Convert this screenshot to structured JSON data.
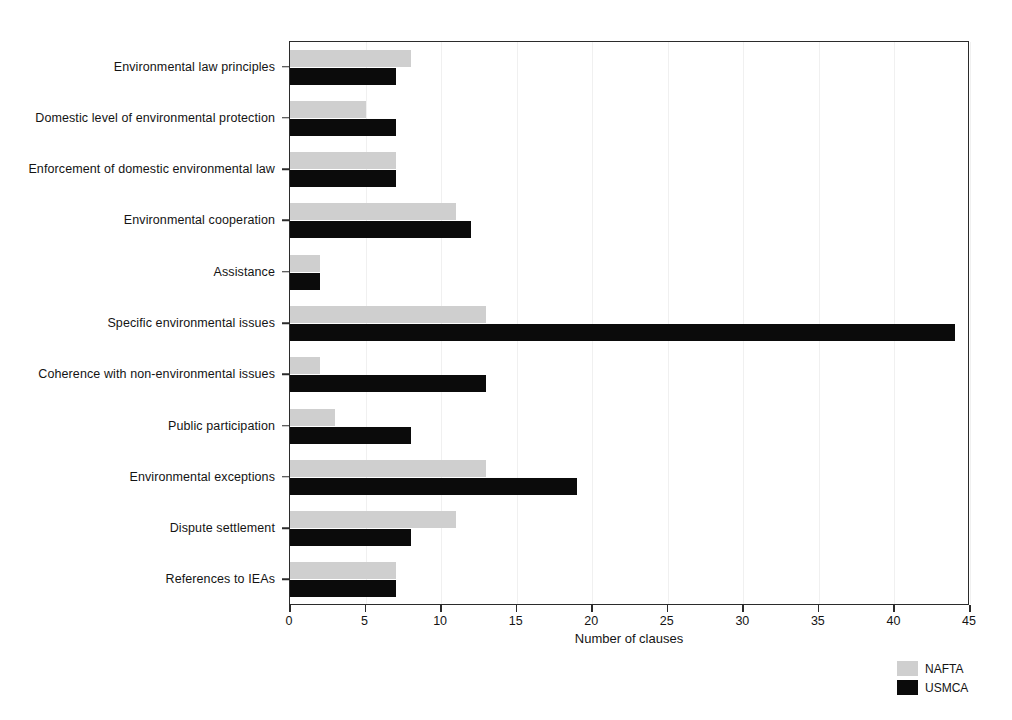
{
  "chart_data": {
    "type": "bar",
    "orientation": "horizontal",
    "title": "",
    "xlabel": "Number of clauses",
    "ylabel": "",
    "xlim": [
      0,
      45
    ],
    "xticks": [
      0,
      5,
      10,
      15,
      20,
      25,
      30,
      35,
      40,
      45
    ],
    "grid": true,
    "legend_position": "bottom-right",
    "categories": [
      "Environmental law principles",
      "Domestic level of environmental protection",
      "Enforcement of domestic environmental law",
      "Environmental cooperation",
      "Assistance",
      "Specific environmental issues",
      "Coherence with non-environmental issues",
      "Public participation",
      "Environmental exceptions",
      "Dispute settlement",
      "References to IEAs"
    ],
    "series": [
      {
        "name": "NAFTA",
        "color": "#cfcfcf",
        "values": [
          8,
          5,
          7,
          11,
          2,
          13,
          2,
          3,
          13,
          11,
          7
        ]
      },
      {
        "name": "USMCA",
        "color": "#0b0b0b",
        "values": [
          7,
          7,
          7,
          12,
          2,
          44,
          13,
          8,
          19,
          8,
          7
        ]
      }
    ]
  },
  "legend": {
    "items": [
      {
        "label": "NAFTA",
        "color": "#cfcfcf"
      },
      {
        "label": "USMCA",
        "color": "#0b0b0b"
      }
    ]
  },
  "axis": {
    "x_title": "Number of clauses",
    "tick_labels": [
      "0",
      "5",
      "10",
      "15",
      "20",
      "25",
      "30",
      "35",
      "40",
      "45"
    ]
  }
}
